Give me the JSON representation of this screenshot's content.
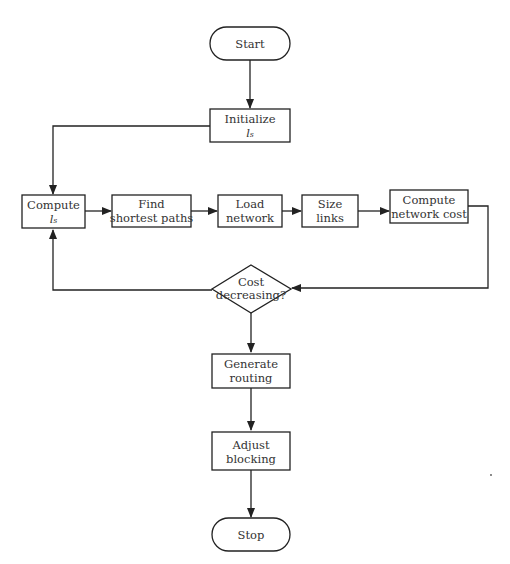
{
  "diagram": {
    "type": "flowchart",
    "nodes": {
      "start": {
        "shape": "terminator",
        "lines": [
          "Start"
        ]
      },
      "initialize": {
        "shape": "process",
        "lines": [
          "Initialize",
          "lₛ"
        ]
      },
      "compute_ls": {
        "shape": "process",
        "lines": [
          "Compute",
          "lₛ"
        ]
      },
      "find_paths": {
        "shape": "process",
        "lines": [
          "Find",
          "shortest paths"
        ]
      },
      "load_network": {
        "shape": "process",
        "lines": [
          "Load",
          "network"
        ]
      },
      "size_links": {
        "shape": "process",
        "lines": [
          "Size",
          "links"
        ]
      },
      "compute_cost": {
        "shape": "process",
        "lines": [
          "Compute",
          "network cost"
        ]
      },
      "cost_decreasing": {
        "shape": "decision",
        "lines": [
          "Cost",
          "decreasing?"
        ]
      },
      "generate_routing": {
        "shape": "process",
        "lines": [
          "Generate",
          "routing"
        ]
      },
      "adjust_blocking": {
        "shape": "process",
        "lines": [
          "Adjust",
          "blocking"
        ]
      },
      "stop": {
        "shape": "terminator",
        "lines": [
          "Stop"
        ]
      }
    },
    "edges": [
      {
        "from": "start",
        "to": "initialize"
      },
      {
        "from": "initialize",
        "to": "compute_ls"
      },
      {
        "from": "compute_ls",
        "to": "find_paths"
      },
      {
        "from": "find_paths",
        "to": "load_network"
      },
      {
        "from": "load_network",
        "to": "size_links"
      },
      {
        "from": "size_links",
        "to": "compute_cost"
      },
      {
        "from": "compute_cost",
        "to": "cost_decreasing"
      },
      {
        "from": "cost_decreasing",
        "to": "compute_ls",
        "note": "loop back (yes)"
      },
      {
        "from": "cost_decreasing",
        "to": "generate_routing"
      },
      {
        "from": "generate_routing",
        "to": "adjust_blocking"
      },
      {
        "from": "adjust_blocking",
        "to": "stop"
      }
    ]
  }
}
